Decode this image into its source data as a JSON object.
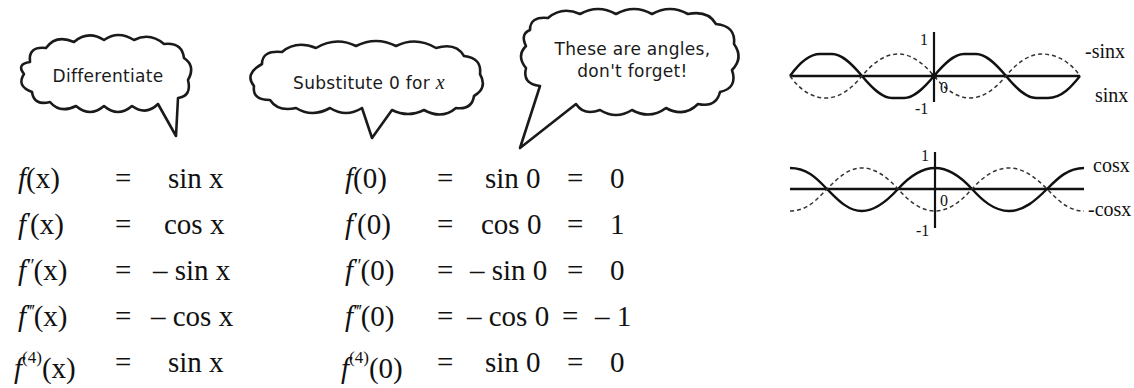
{
  "bubbles": [
    {
      "id": "differentiate",
      "text": "Differentiate"
    },
    {
      "id": "substitute",
      "text_prefix": "Substitute 0 for ",
      "text_var": "x"
    },
    {
      "id": "angles",
      "line1": "These are angles,",
      "line2": "don't forget!"
    }
  ],
  "derivatives": [
    {
      "fn": "f",
      "order_mark": "",
      "arg": "(x)",
      "eq": "=",
      "rhs": "sin x"
    },
    {
      "fn": "f",
      "order_mark": "′",
      "arg": "(x)",
      "eq": "=",
      "rhs": "cos x"
    },
    {
      "fn": "f",
      "order_mark": "″",
      "arg": "(x)",
      "eq": "=",
      "rhs": "– sin x"
    },
    {
      "fn": "f",
      "order_mark": "‴",
      "arg": "(x)",
      "eq": "=",
      "rhs": "– cos x"
    },
    {
      "fn": "f",
      "order_mark": "(4)",
      "arg": "(x)",
      "eq": "=",
      "rhs": "sin x"
    }
  ],
  "evaluations": [
    {
      "fn": "f",
      "order_mark": "",
      "arg": "(0)",
      "eq1": "=",
      "mid": "sin 0",
      "eq2": "=",
      "value": "0"
    },
    {
      "fn": "f",
      "order_mark": "′",
      "arg": "(0)",
      "eq1": "=",
      "mid": "cos 0",
      "eq2": "=",
      "value": "1"
    },
    {
      "fn": "f",
      "order_mark": "″",
      "arg": "(0)",
      "eq1": "=",
      "mid": "– sin 0",
      "eq2": "=",
      "value": "0"
    },
    {
      "fn": "f",
      "order_mark": "‴",
      "arg": "(0)",
      "eq1": "=",
      "mid": "– cos 0",
      "eq2": "=",
      "value": "– 1"
    },
    {
      "fn": "f",
      "order_mark": "(4)",
      "arg": "(0)",
      "eq1": "=",
      "mid": "sin 0",
      "eq2": "=",
      "value": "0"
    }
  ],
  "graphs": {
    "top": {
      "tick_top": "1",
      "tick_origin": "0",
      "tick_bottom": "-1",
      "label_dashed": "-sinx",
      "label_solid": "sinx",
      "solid_curve": "sin x",
      "dashed_curve": "-sin x"
    },
    "bottom": {
      "tick_top": "1",
      "tick_origin": "0",
      "tick_bottom": "-1",
      "label_solid": "cosx",
      "label_dashed": "-cosx",
      "solid_curve": "cos x",
      "dashed_curve": "-cos x"
    }
  },
  "colors": {
    "ink": "#111111",
    "background": "#ffffff"
  }
}
